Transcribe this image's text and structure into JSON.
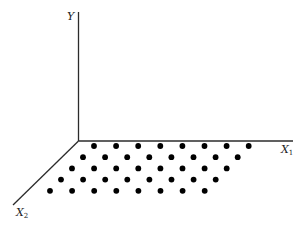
{
  "diagram": {
    "type": "3d-axes-lattice",
    "axes": {
      "y": {
        "label": "Y",
        "subscript": ""
      },
      "x1": {
        "label": "X",
        "subscript": "1"
      },
      "x2": {
        "label": "X",
        "subscript": "2"
      }
    },
    "lattice": {
      "rows": 5,
      "cols": 8,
      "description": "Regular grid of points lying in the X1-X2 plane"
    }
  }
}
